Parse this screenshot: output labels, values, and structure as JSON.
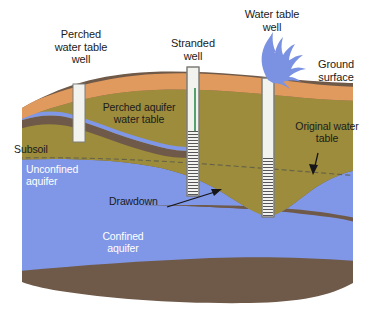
{
  "figure": {
    "background_color": "#ffffff"
  },
  "labels": {
    "perched_well": "Perched\nwater table\nwell",
    "stranded_well": "Stranded\nwell",
    "water_table_well": "Water table\nwell",
    "ground_surface": "Ground\nsurface",
    "perched_aquifer": "Perched aquifer\nwater table",
    "subsoil": "Subsoil",
    "unconfined_aquifer": "Unconfined\naquifer",
    "confined_aquifer": "Confined\naquifer",
    "original_water_table": "Original water\ntable",
    "drawdown": "Drawdown"
  },
  "colors": {
    "topsoil_orange": "#e09a5e",
    "soil_olive": "#9c8c3c",
    "clay_brown": "#6f5949",
    "aquifer_blue": "#7f97e6",
    "well_casing": "#f2f2ef",
    "well_casing_edge": "#7c7c78",
    "well_screen_line": "#55555a",
    "spray_blue": "#7b92e2",
    "stranded_screen_green": "#2e8a52",
    "water_table_dash": "#5a5a4a",
    "label_dark": "#1b1b1b",
    "label_white": "#ffffff",
    "arrow_dark": "#16161a"
  },
  "icons": {
    "water_spray": "water-spray-icon",
    "drawdown_arrow": "arrow-up-right-icon",
    "original_water_table_arrow": "arrow-down-icon"
  },
  "strata": [
    {
      "name": "topsoil",
      "label": "Ground surface / topsoil",
      "color": "#e09a5e"
    },
    {
      "name": "subsoil",
      "label": "Subsoil",
      "color": "#9c8c3c"
    },
    {
      "name": "perched-clay-lens",
      "label": "Perched clay lens",
      "color": "#6f5949"
    },
    {
      "name": "perched-water",
      "label": "Perched aquifer water",
      "color": "#7f97e6"
    },
    {
      "name": "unconfined-aquifer",
      "label": "Unconfined aquifer",
      "color": "#7f97e6"
    },
    {
      "name": "confining-layer-upper",
      "label": "Upper confining bed",
      "color": "#6f5949"
    },
    {
      "name": "confined-aquifer",
      "label": "Confined aquifer",
      "color": "#7f97e6"
    },
    {
      "name": "confining-layer-lower",
      "label": "Lower confining bed",
      "color": "#6f5949"
    }
  ],
  "wells": [
    {
      "name": "perched-water-table-well",
      "label": "Perched water table well",
      "x": 79,
      "top": 84,
      "bottom": 142,
      "screened": false
    },
    {
      "name": "stranded-well",
      "label": "Stranded well",
      "x": 193,
      "top": 67,
      "bottom": 196,
      "screened": true
    },
    {
      "name": "water-table-well",
      "label": "Water table well",
      "x": 268,
      "top": 78,
      "bottom": 217,
      "screened": true,
      "pumping": true
    }
  ]
}
